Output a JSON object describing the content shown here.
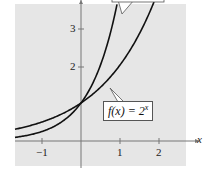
{
  "chart_data": {
    "type": "line",
    "title": "",
    "xlabel": "x",
    "ylabel": "",
    "xlim": [
      -1.7,
      2.65
    ],
    "ylim": [
      -0.65,
      3.6
    ],
    "x_ticks": [
      "-1",
      "1",
      "2"
    ],
    "y_ticks": [
      "2",
      "3"
    ],
    "grid": false,
    "background": "#e6e6e6",
    "series": [
      {
        "name": "f(x) = 2^x",
        "base": 2,
        "label_visible": true
      },
      {
        "name": "g(x) (label cut off)",
        "base": 4,
        "label_visible": false
      }
    ],
    "intersection": {
      "x": 0,
      "y": 1
    }
  },
  "labels": {
    "x_axis": "x",
    "tick_x_neg1": "−1",
    "tick_x_1": "1",
    "tick_x_2": "2",
    "tick_y_2": "2",
    "tick_y_3": "3",
    "callout_f": "f(x) = 2",
    "callout_f_exp": "x"
  }
}
